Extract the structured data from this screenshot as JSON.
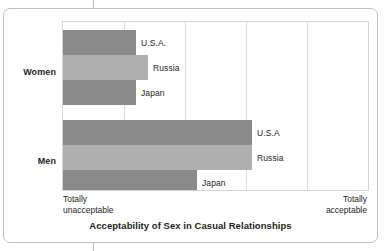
{
  "chart_data": {
    "type": "bar",
    "orientation": "horizontal",
    "title": "Acceptability of Sex in Casual Relationships",
    "xlabel": "",
    "ylabel": "",
    "xlim": [
      0,
      100
    ],
    "grid": true,
    "gridline_count": 4,
    "legend": "inline-labels",
    "axis_endpoints": {
      "left_line1": "Totally",
      "left_line2": "unacceptable",
      "right_line1": "Totally",
      "right_line2": "acceptable"
    },
    "groups": [
      {
        "name": "Women",
        "bars": [
          {
            "label": "U.S.A.",
            "value": 24,
            "shade": "dark"
          },
          {
            "label": "Russia",
            "value": 28,
            "shade": "light"
          },
          {
            "label": "Japan",
            "value": 24,
            "shade": "dark"
          }
        ]
      },
      {
        "name": "Men",
        "bars": [
          {
            "label": "U.S.A",
            "value": 62,
            "shade": "dark"
          },
          {
            "label": "Russia",
            "value": 62,
            "shade": "light"
          },
          {
            "label": "Japan",
            "value": 44,
            "shade": "dark"
          }
        ]
      }
    ],
    "colors": {
      "bar_dark": "#8a8a8a",
      "bar_light": "#b0b0b0",
      "gridline": "#dddddd",
      "plot_border": "#d4d4d4",
      "card_border": "#c2c2c2",
      "text": "#231f20",
      "background": "#ffffff"
    }
  }
}
